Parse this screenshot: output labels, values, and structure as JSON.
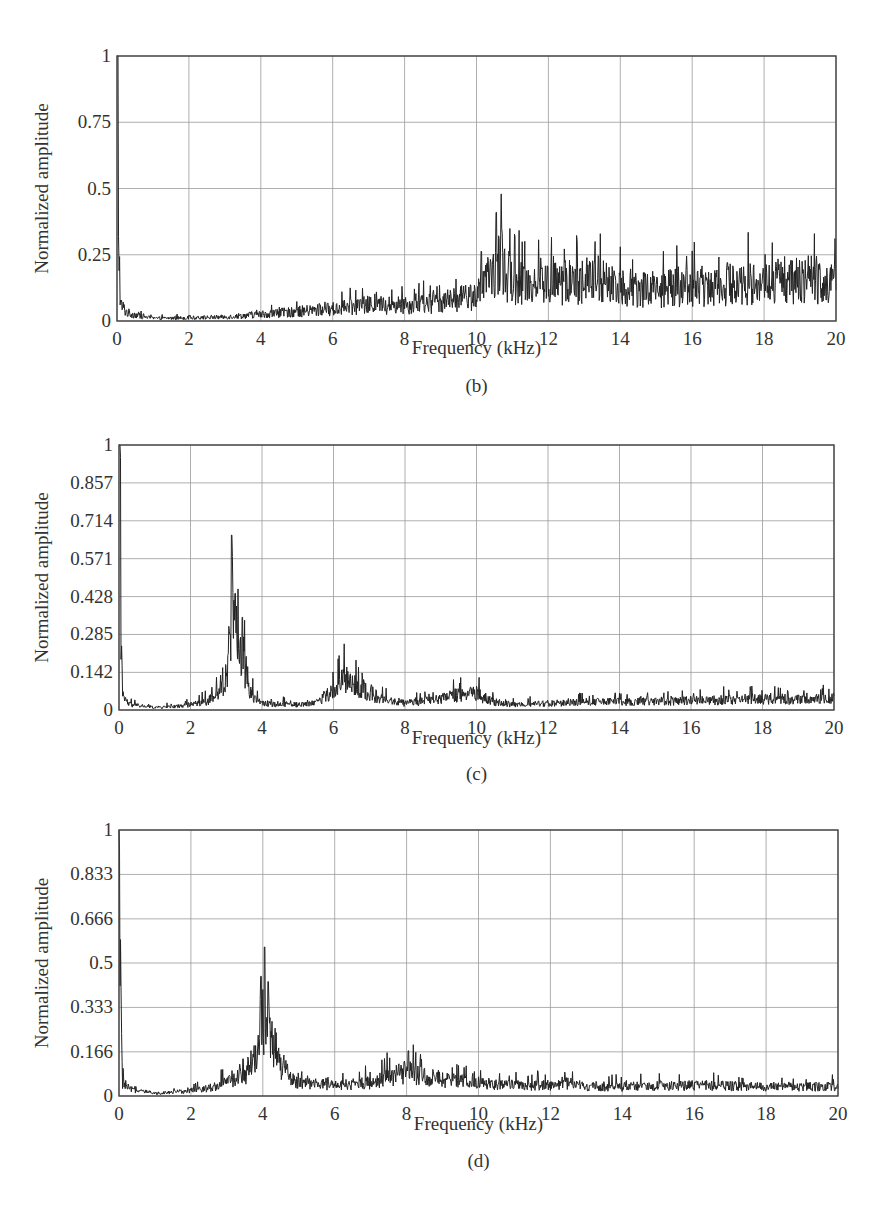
{
  "chart_data": [
    {
      "id": "b",
      "type": "line",
      "panel_label": "(b)",
      "title": "",
      "xlabel": "Frequency (kHz)",
      "ylabel": "Normalized amplitude",
      "xlim": [
        0,
        20
      ],
      "ylim": [
        0,
        1
      ],
      "x_ticks": [
        "0",
        "2",
        "4",
        "6",
        "8",
        "10",
        "12",
        "14",
        "16",
        "18",
        "20"
      ],
      "y_ticks": [
        "0",
        "0.25",
        "0.5",
        "0.75",
        "1"
      ],
      "y_tick_values": [
        0,
        0.25,
        0.5,
        0.75,
        1
      ],
      "grid": true,
      "legend": null,
      "box": {
        "left": 117,
        "top": 56,
        "right": 836,
        "bottom": 321
      },
      "xlabel_y": 354,
      "panel_label_y": 392,
      "series": [
        {
          "name": "spectrum",
          "envelope_x": [
            0,
            0.02,
            0.05,
            0.1,
            0.3,
            1,
            2,
            3,
            4,
            5,
            6,
            7,
            8,
            9,
            9.8,
            10.2,
            10.5,
            10.6,
            10.8,
            11,
            12,
            13,
            13.3,
            14,
            15,
            16,
            17,
            18,
            19,
            19.4,
            20
          ],
          "envelope_y": [
            1.0,
            0.98,
            0.3,
            0.06,
            0.03,
            0.01,
            0.012,
            0.015,
            0.025,
            0.035,
            0.045,
            0.06,
            0.06,
            0.07,
            0.09,
            0.12,
            0.2,
            0.22,
            0.18,
            0.15,
            0.14,
            0.15,
            0.16,
            0.13,
            0.12,
            0.13,
            0.14,
            0.14,
            0.15,
            0.16,
            0.14
          ],
          "noise": 0.6,
          "peaks": [
            {
              "x": 10.55,
              "y": 0.41
            },
            {
              "x": 10.7,
              "y": 0.35
            },
            {
              "x": 13.3,
              "y": 0.3
            },
            {
              "x": 14.0,
              "y": 0.28
            },
            {
              "x": 19.4,
              "y": 0.33
            },
            {
              "x": 12.8,
              "y": 0.3
            }
          ]
        }
      ]
    },
    {
      "id": "c",
      "type": "line",
      "panel_label": "(c)",
      "title": "",
      "xlabel": "Frequency (kHz)",
      "ylabel": "Normalized amplitude",
      "xlim": [
        0,
        20
      ],
      "ylim": [
        0,
        1
      ],
      "x_ticks": [
        "0",
        "2",
        "4",
        "6",
        "8",
        "10",
        "12",
        "14",
        "16",
        "18",
        "20"
      ],
      "y_ticks": [
        "0",
        "0.142",
        "0.285",
        "0.428",
        "0.571",
        "0.714",
        "0.857",
        "1"
      ],
      "y_tick_values": [
        0,
        0.142,
        0.285,
        0.428,
        0.571,
        0.714,
        0.857,
        1
      ],
      "grid": true,
      "legend": null,
      "box": {
        "left": 119,
        "top": 445,
        "right": 834,
        "bottom": 710
      },
      "xlabel_y": 744,
      "panel_label_y": 780,
      "series": [
        {
          "name": "spectrum",
          "envelope_x": [
            0,
            0.02,
            0.05,
            0.1,
            0.3,
            1,
            1.5,
            2,
            2.5,
            2.8,
            3.0,
            3.15,
            3.3,
            3.5,
            3.7,
            4,
            5,
            5.5,
            6,
            6.3,
            6.6,
            7,
            7.3,
            8,
            9,
            9.5,
            10,
            10.5,
            11,
            12,
            13,
            14,
            16,
            18,
            20
          ],
          "envelope_y": [
            0.96,
            0.94,
            0.3,
            0.05,
            0.02,
            0.01,
            0.012,
            0.02,
            0.035,
            0.06,
            0.12,
            0.4,
            0.33,
            0.18,
            0.06,
            0.025,
            0.02,
            0.03,
            0.07,
            0.12,
            0.09,
            0.07,
            0.04,
            0.025,
            0.04,
            0.06,
            0.06,
            0.03,
            0.02,
            0.025,
            0.03,
            0.03,
            0.035,
            0.04,
            0.04
          ],
          "noise": 0.5,
          "peaks": [
            {
              "x": 3.15,
              "y": 0.66
            },
            {
              "x": 3.25,
              "y": 0.44
            },
            {
              "x": 3.45,
              "y": 0.35
            },
            {
              "x": 2.9,
              "y": 0.16
            },
            {
              "x": 6.3,
              "y": 0.25
            },
            {
              "x": 6.8,
              "y": 0.14
            },
            {
              "x": 10.0,
              "y": 0.09
            }
          ]
        }
      ]
    },
    {
      "id": "d",
      "type": "line",
      "panel_label": "(d)",
      "title": "",
      "xlabel": "Frequency (kHz)",
      "ylabel": "Normalized amplitude",
      "xlim": [
        0,
        20
      ],
      "ylim": [
        0,
        1
      ],
      "x_ticks": [
        "0",
        "2",
        "4",
        "6",
        "8",
        "10",
        "12",
        "14",
        "16",
        "18",
        "20"
      ],
      "y_ticks": [
        "0",
        "0.166",
        "0.333",
        "0.5",
        "0.666",
        "0.833",
        "1"
      ],
      "y_tick_values": [
        0,
        0.166,
        0.333,
        0.5,
        0.666,
        0.833,
        1
      ],
      "grid": true,
      "legend": null,
      "box": {
        "left": 119,
        "top": 830,
        "right": 838,
        "bottom": 1096
      },
      "xlabel_y": 1130,
      "panel_label_y": 1167,
      "series": [
        {
          "name": "spectrum",
          "envelope_x": [
            0,
            0.02,
            0.05,
            0.1,
            0.3,
            1,
            1.5,
            2,
            2.5,
            3,
            3.5,
            3.8,
            4.0,
            4.2,
            4.5,
            4.8,
            5,
            6,
            7,
            7.5,
            8,
            8.3,
            9,
            10,
            11,
            12,
            12.4,
            13,
            14,
            16,
            18,
            20
          ],
          "envelope_y": [
            0.9,
            0.85,
            0.3,
            0.05,
            0.025,
            0.01,
            0.015,
            0.02,
            0.03,
            0.05,
            0.08,
            0.15,
            0.3,
            0.22,
            0.12,
            0.06,
            0.05,
            0.04,
            0.05,
            0.07,
            0.09,
            0.08,
            0.06,
            0.05,
            0.04,
            0.04,
            0.05,
            0.035,
            0.035,
            0.04,
            0.035,
            0.035
          ],
          "noise": 0.5,
          "peaks": [
            {
              "x": 4.05,
              "y": 0.56
            },
            {
              "x": 3.95,
              "y": 0.45
            },
            {
              "x": 4.15,
              "y": 0.43
            },
            {
              "x": 3.45,
              "y": 0.14
            },
            {
              "x": 8.05,
              "y": 0.17
            },
            {
              "x": 12.4,
              "y": 0.09
            }
          ]
        }
      ]
    }
  ]
}
